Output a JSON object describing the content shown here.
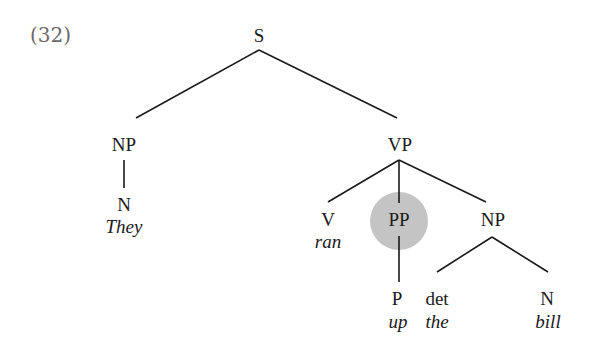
{
  "example_number": "(32)",
  "tree": {
    "root": "S",
    "nodes": {
      "S": "S",
      "NP_subj": "NP",
      "N_subj": "N",
      "They": "They",
      "VP": "VP",
      "V": "V",
      "ran": "ran",
      "PP": "PP",
      "P": "P",
      "up": "up",
      "NP_obj": "NP",
      "det": "det",
      "the": "the",
      "N_obj": "N",
      "bill": "bill"
    },
    "highlighted_node": "PP",
    "highlight_color": "#c4c4c4"
  }
}
